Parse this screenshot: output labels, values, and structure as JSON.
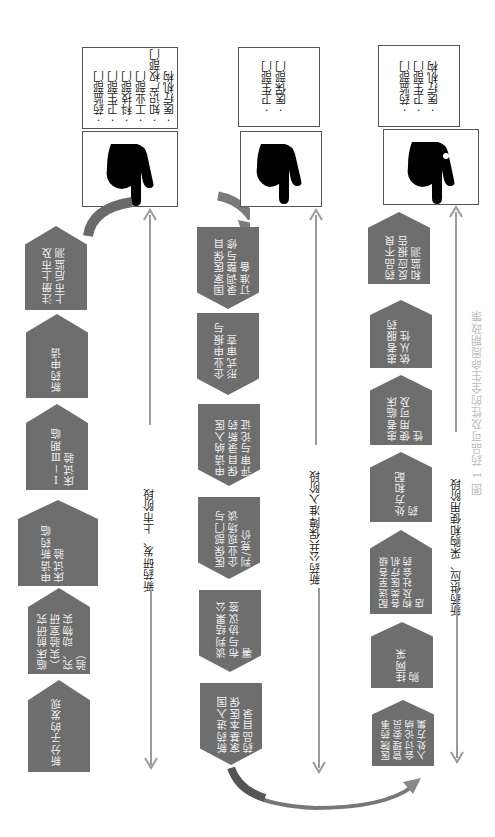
{
  "figure": {
    "caption": "图 1  药品可及性的全生命周期政策",
    "orientation": "rotated 90° counter-clockwise",
    "colors": {
      "box_fill": "#6e6e6e",
      "box_text": "#f2f2f2",
      "line": "#9a9a9a",
      "arrow": "#707070"
    }
  },
  "stages": [
    {
      "label": "新药研发、上市阶段",
      "steps": [
        "新分子的发现",
        "临床前研究（实验室研究、动物实验）",
        "申请新药临床试验",
        "Ⅰ－Ⅲ期临床试验",
        "新药申请",
        "注册上市及上市后监测"
      ],
      "departments": [
        "药监部门",
        "卫生部门",
        "科技部门",
        "工业部门",
        "知识产权部门",
        "医疗机构"
      ],
      "hand_icon": "pointing-hand-icon"
    },
    {
      "label": "新药公共保障准入阶段",
      "steps": [
        "国家医保目录调整与修订准备",
        "企业申报与形式审查",
        "申请纳入医保目录新药评审与论证",
        "医保部门与企业现场谈判/竞价",
        "谈判结果公布与协议签署",
        "新药进入国家基本医保药品目录"
      ],
      "departments": [
        "卫生部门",
        "医保部门"
      ],
      "hand_icon": "pointing-hand-icon"
    },
    {
      "label": "新药供应、采购和使用阶段",
      "steps": [
        "医院药事管理委员会讨论纳入处方集",
        "挂网采购",
        "配送至各级各类医疗机构及社会药店",
        "处方和配药",
        "患者临床使用可及性",
        "患者服药依从性",
        "药品不良反应报告和监测"
      ],
      "departments": [
        "药监部门",
        "卫生部门",
        "医疗机构"
      ],
      "hand_icon": "pointing-hand-icon"
    }
  ]
}
